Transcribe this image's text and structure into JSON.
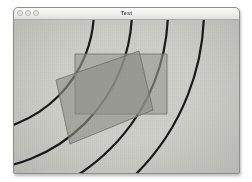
{
  "window": {
    "title": "Test",
    "controls": [
      {
        "name": "close-button",
        "label": "Close"
      },
      {
        "name": "minimize-button",
        "label": "Minimize"
      },
      {
        "name": "zoom-button",
        "label": "Zoom"
      }
    ]
  },
  "canvas": {
    "background_color": "#cfcfca",
    "stroke_color": "#1a1a1a",
    "stroke_width": 2.2,
    "arc_center": {
      "x": -42,
      "y": -10
    },
    "arc_radii": [
      122,
      160,
      196,
      232
    ],
    "shapes": [
      {
        "name": "upright-rectangle",
        "type": "rect",
        "fill": "#9a9a95",
        "opacity": 0.62,
        "stroke": "#6f6f6a",
        "points": "61,34 153,34 153,94 61,94"
      },
      {
        "name": "rotated-rectangle",
        "type": "polygon",
        "fill": "#8f8f8a",
        "opacity": 0.62,
        "stroke": "#6f6f6a",
        "points": "42,60 125,31 139,90 56,124"
      }
    ]
  }
}
